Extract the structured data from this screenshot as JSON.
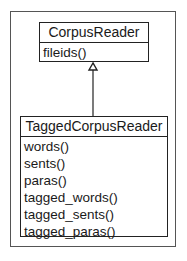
{
  "diagram": {
    "type": "uml-class-inheritance",
    "classes": [
      {
        "name": "CorpusReader",
        "methods": [
          "fileids()"
        ]
      },
      {
        "name": "TaggedCorpusReader",
        "methods": [
          "words()",
          "sents()",
          "paras()",
          "tagged_words()",
          "tagged_sents()",
          "tagged_paras()"
        ]
      }
    ],
    "relations": [
      {
        "from": "TaggedCorpusReader",
        "to": "CorpusReader",
        "kind": "generalization"
      }
    ]
  }
}
